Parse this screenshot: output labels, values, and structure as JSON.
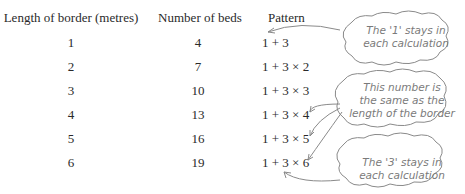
{
  "table": {
    "headers": [
      "Length of border (metres)",
      "Number of beds",
      "Pattern"
    ],
    "rows": [
      {
        "length": "1",
        "beds": "4",
        "pattern": "1 + 3"
      },
      {
        "length": "2",
        "beds": "7",
        "pattern": "1 + 3 × 2"
      },
      {
        "length": "3",
        "beds": "10",
        "pattern": "1 + 3 × 3"
      },
      {
        "length": "4",
        "beds": "13",
        "pattern": "1 + 3 × 4"
      },
      {
        "length": "5",
        "beds": "16",
        "pattern": "1 + 3 × 5"
      },
      {
        "length": "6",
        "beds": "19",
        "pattern": "1 + 3 × 6"
      }
    ]
  },
  "notes": [
    {
      "line1": "The '1' stays in",
      "line2": "each calculation"
    },
    {
      "line1": "This number is",
      "line2": "the same as the",
      "line3": "length of the border"
    },
    {
      "line1": "The '3' stays in",
      "line2": "each calculation"
    }
  ]
}
